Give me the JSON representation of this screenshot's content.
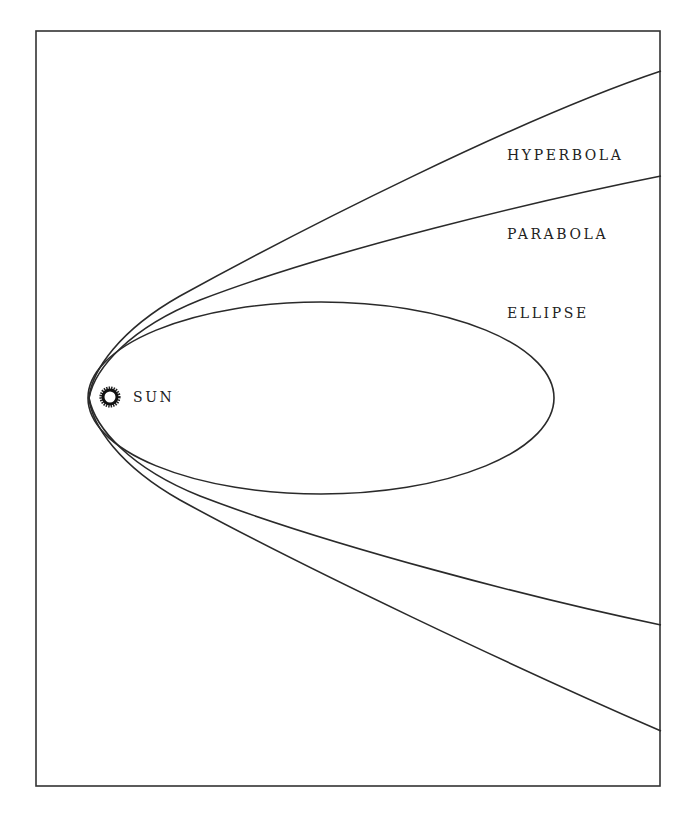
{
  "diagram": {
    "labels": {
      "hyperbola": "HYPERBOLA",
      "parabola": "PARABOLA",
      "ellipse": "ELLIPSE",
      "sun": "SUN"
    },
    "curves": [
      {
        "name": "hyperbola",
        "type": "open"
      },
      {
        "name": "parabola",
        "type": "open"
      },
      {
        "name": "ellipse",
        "type": "closed"
      }
    ],
    "colors": {
      "line": "#2a2a2a",
      "background": "#ffffff",
      "text": "#222222"
    }
  }
}
